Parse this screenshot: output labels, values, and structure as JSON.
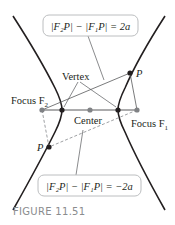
{
  "figure": {
    "caption": "FIGURE 11.51",
    "labels": {
      "vertex": "Vertex",
      "center": "Center",
      "focus_left": "Focus F",
      "focus_left_sub": "2",
      "focus_right": "Focus F",
      "focus_right_sub": "1",
      "point_upper": "P",
      "point_lower": "P"
    },
    "equations": {
      "upper": "|F₂P| − |F₁P| = 2a",
      "lower": "|F₂P| − |F₁P| = −2a"
    },
    "colors": {
      "curve": "#231f20",
      "focus_point": "#808285",
      "dashed_line": "#939598",
      "thin_line": "#58595b",
      "box_border": "#bcbec0",
      "caption": "#8a8c8e"
    }
  }
}
